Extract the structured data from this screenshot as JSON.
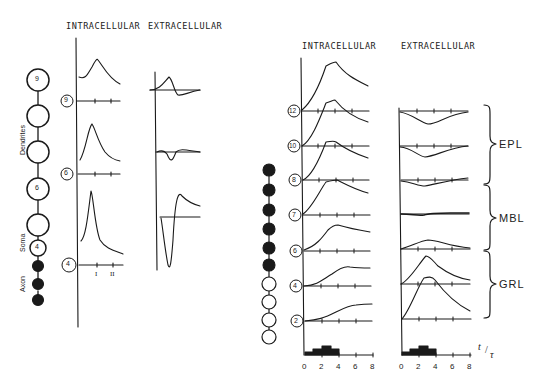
{
  "left_panel": {
    "headers": {
      "intracellular": "INTRACELLULAR",
      "extracellular": "EXTRACELLULAR"
    },
    "side_labels": {
      "dendrites": "Dendrites",
      "soma": "Soma",
      "axon": "Axon"
    },
    "chain": [
      {
        "label": "9",
        "type": "open-large"
      },
      {
        "label": "",
        "type": "open-large"
      },
      {
        "label": "",
        "type": "open-large"
      },
      {
        "label": "6",
        "type": "open-large"
      },
      {
        "label": "",
        "type": "open-large"
      },
      {
        "label": "4",
        "type": "open-small"
      },
      {
        "label": "",
        "type": "filled"
      },
      {
        "label": "",
        "type": "filled"
      },
      {
        "label": "",
        "type": "filled"
      }
    ],
    "trace_markers": [
      "9",
      "6",
      "4"
    ],
    "time_tick_labels": [
      "I",
      "II"
    ]
  },
  "right_panel": {
    "headers": {
      "intracellular": "INTRACELLULAR",
      "extracellular": "EXTRACELLULAR"
    },
    "trace_markers": [
      "12",
      "10",
      "8",
      "7",
      "6",
      "4",
      "2"
    ],
    "chain_filled_count": 6,
    "chain_open_count": 7,
    "layers": [
      {
        "label": "EPL"
      },
      {
        "label": "MBL"
      },
      {
        "label": "GRL"
      }
    ],
    "x_axis": {
      "ticks": [
        "0",
        "2",
        "4",
        "6",
        "8"
      ],
      "label": "t/τ",
      "label_num": "t",
      "label_den": "τ"
    }
  },
  "colors": {
    "ink": "#1a1a1a",
    "background": "#ffffff"
  }
}
